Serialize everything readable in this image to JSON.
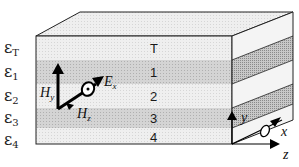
{
  "diagram": {
    "colors": {
      "light_layer": "#ececec",
      "dark_layer": "#cfcfcf",
      "top_face": "#f1f1f1",
      "side_light": "#f4f4f4",
      "side_dark": "#bdbdbd",
      "outline": "#222222",
      "arrow": "#000000"
    },
    "permittivity_labels": [
      {
        "symbol": "ε",
        "sub": "T"
      },
      {
        "symbol": "ε",
        "sub": "1"
      },
      {
        "symbol": "ε",
        "sub": "2"
      },
      {
        "symbol": "ε",
        "sub": "3"
      },
      {
        "symbol": "ε",
        "sub": "4"
      }
    ],
    "layers": [
      {
        "label": "T",
        "shade": "light"
      },
      {
        "label": "1",
        "shade": "dark"
      },
      {
        "label": "2",
        "shade": "light"
      },
      {
        "label": "3",
        "shade": "dark"
      },
      {
        "label": "4",
        "shade": "light"
      }
    ],
    "fields": {
      "hy": {
        "base": "H",
        "sub": "y"
      },
      "ex": {
        "base": "E",
        "sub": "x"
      },
      "hz": {
        "base": "H",
        "sub": "z"
      }
    },
    "axes": {
      "y": "y",
      "x": "x",
      "z": "z"
    }
  }
}
